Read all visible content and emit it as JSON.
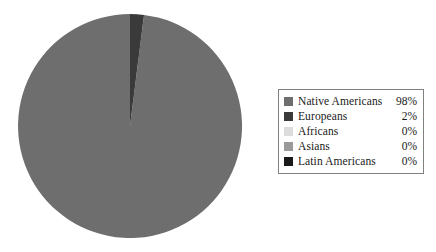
{
  "chart_data": {
    "type": "pie",
    "title": "",
    "subtitle": "",
    "xlabel": "",
    "ylabel": "",
    "grid": false,
    "legend_position": "right",
    "start_angle_deg": 90,
    "direction": "counterclockwise",
    "categories": [
      "Native Americans",
      "Europeans",
      "Africans",
      "Asians",
      "Latin Americans"
    ],
    "values": [
      98,
      2,
      0,
      0,
      0
    ],
    "value_unit": "%",
    "slices": [
      {
        "label": "Native Americans",
        "value": 98,
        "display": "98%",
        "color": "#6e6e6e"
      },
      {
        "label": "Europeans",
        "value": 2,
        "display": "2%",
        "color": "#3a3a3a"
      },
      {
        "label": "Africans",
        "value": 0,
        "display": "0%",
        "color": "#dcdcdc"
      },
      {
        "label": "Asians",
        "value": 0,
        "display": "0%",
        "color": "#9a9a9a"
      },
      {
        "label": "Latin Americans",
        "value": 0,
        "display": "0%",
        "color": "#1a1a1a"
      }
    ]
  },
  "legend": {
    "items": [
      {
        "label": "Native Americans",
        "percent": "98%",
        "color": "#6e6e6e"
      },
      {
        "label": "Europeans",
        "percent": "2%",
        "color": "#3a3a3a"
      },
      {
        "label": "Africans",
        "percent": "0%",
        "color": "#dcdcdc"
      },
      {
        "label": "Asians",
        "percent": "0%",
        "color": "#9a9a9a"
      },
      {
        "label": "Latin Americans",
        "percent": "0%",
        "color": "#1a1a1a"
      }
    ]
  },
  "geometry": {
    "center_x": 130,
    "center_y": 126,
    "radius": 112
  },
  "colors": {
    "background": "#ffffff",
    "legend_border": "#808080",
    "text": "#1a1a1a"
  }
}
